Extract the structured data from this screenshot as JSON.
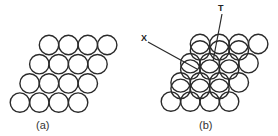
{
  "figure": {
    "panel_a": {
      "label": "(a)",
      "description": "Single close-packed layer of spheres (4 rows x 4)"
    },
    "panel_b": {
      "label": "(b)",
      "description": "Second close-packed layer placed over the first",
      "annotations": [
        {
          "id": "X",
          "text": "X"
        },
        {
          "id": "T",
          "text": "T"
        }
      ]
    }
  },
  "style": {
    "stroke": "#2a2a2a",
    "background": "#ffffff"
  }
}
